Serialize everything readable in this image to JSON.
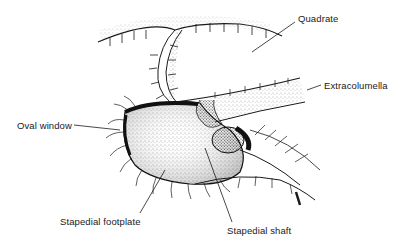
{
  "figure": {
    "type": "anatomical illustration",
    "labels": {
      "quadrate": "Quadrate",
      "extracolumella": "Extracolumella",
      "oval_window": "Oval window",
      "stapedial_footplate": "Stapedial footplate",
      "stapedial_shaft": "Stapedial shaft"
    },
    "colors": {
      "ink": "#1a1a1a",
      "background": "#ffffff"
    }
  }
}
